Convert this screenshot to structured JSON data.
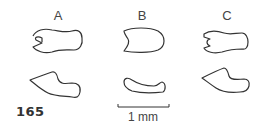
{
  "figure": {
    "number": "165",
    "columns": [
      {
        "label": "A",
        "x": 58
      },
      {
        "label": "B",
        "x": 142
      },
      {
        "label": "C",
        "x": 227
      }
    ],
    "scale_bar": {
      "label": "1 mm",
      "length_px": 50
    },
    "colors": {
      "stroke": "#333333",
      "background": "#ffffff"
    }
  }
}
